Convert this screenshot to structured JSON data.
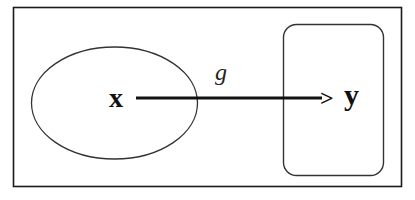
{
  "diagram": {
    "domain_set": {
      "label": "x"
    },
    "codomain_set": {
      "label": "y"
    },
    "mapping": {
      "label": "g",
      "arrowhead": ">"
    }
  },
  "colors": {
    "stroke": "#1a1a1a",
    "background": "#ffffff",
    "text": "#111111"
  }
}
